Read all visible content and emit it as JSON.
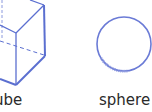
{
  "shapes": [
    {
      "name": "cube",
      "label": "ube"
    },
    {
      "name": "sphere",
      "label": "sphere"
    }
  ],
  "colors": {
    "stroke": "#5b6fd0",
    "text": "#2a2a2a"
  }
}
